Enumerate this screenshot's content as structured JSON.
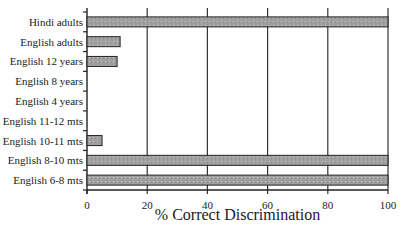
{
  "chart_data": {
    "type": "bar",
    "orientation": "horizontal",
    "title": "",
    "xlabel": "% Correct Discrimination",
    "ylabel": "",
    "xlim": [
      0,
      100
    ],
    "xticks": [
      0,
      20,
      40,
      60,
      80,
      100
    ],
    "xtick_labels": [
      "0",
      "20",
      "40",
      "60",
      "80",
      "100"
    ],
    "grid": "vertical gridlines at each x tick",
    "legend": null,
    "categories": [
      "Hindi adults",
      "English adults",
      "English 12 years",
      "English 8 years",
      "English 4 years",
      "English 11-12 mts",
      "English 10-11 mts",
      "English 8-10 mts",
      "English 6-8 mts"
    ],
    "values": [
      100,
      11,
      10,
      0,
      0,
      0,
      5,
      100,
      100
    ],
    "bar_color": "#a0a0a0",
    "bar_edge_color": "#222222"
  }
}
